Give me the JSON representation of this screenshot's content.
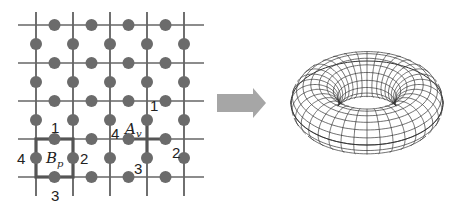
{
  "lattice": {
    "vertical_lines_x": [
      36,
      73,
      110,
      147,
      184
    ],
    "horizontal_lines_y": [
      25,
      63,
      101,
      139,
      177
    ],
    "extent": {
      "x0": 18,
      "x1": 204,
      "y0": 12,
      "y1": 196
    },
    "line_color": "#222222",
    "edge_line_color": "#666666",
    "dot_color": "#6b6b6b",
    "dot_radius": 6,
    "highlight_color": "#555555"
  },
  "plaquette": {
    "operator": "B",
    "subscript": "p",
    "labels": [
      "1",
      "2",
      "3",
      "4"
    ]
  },
  "vertex": {
    "operator": "A",
    "subscript": "v",
    "labels": [
      "1",
      "2",
      "3",
      "4"
    ]
  },
  "arrow": {
    "color": "#a6a6a6",
    "direction": "right"
  },
  "torus": {
    "stroke": "#333333",
    "major_segments": 36,
    "minor_segments": 18
  }
}
